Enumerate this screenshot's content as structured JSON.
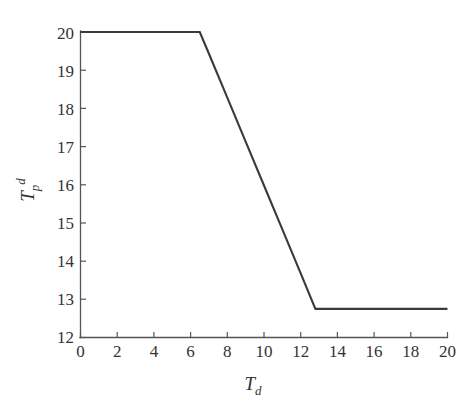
{
  "chart_data": {
    "type": "line",
    "title": "",
    "subtitle": "",
    "xlabel": "T_d",
    "xlabel_base": "T",
    "xlabel_sub": "d",
    "ylabel": "T_p^d",
    "ylabel_base": "T",
    "ylabel_sub": "p",
    "ylabel_sup": "d",
    "xlim": [
      0,
      20
    ],
    "ylim": [
      12,
      20
    ],
    "grid": false,
    "legend": null,
    "legend_position": "none",
    "xticks": [
      0,
      2,
      4,
      6,
      8,
      10,
      12,
      14,
      16,
      18,
      20
    ],
    "xtick_labels": [
      "0",
      "2",
      "4",
      "6",
      "8",
      "10",
      "12",
      "14",
      "16",
      "18",
      "20"
    ],
    "yticks": [
      12,
      13,
      14,
      15,
      16,
      17,
      18,
      19,
      20
    ],
    "ytick_labels": [
      "12",
      "13",
      "14",
      "15",
      "16",
      "17",
      "18",
      "19",
      "20"
    ],
    "series": [
      {
        "name": "Tp_d vs Td",
        "color": "#3a3a3a",
        "x": [
          0.0,
          1.0,
          2.0,
          3.0,
          4.0,
          5.0,
          6.0,
          6.5,
          7.0,
          8.0,
          9.0,
          10.0,
          11.0,
          12.0,
          12.8,
          13.0,
          14.0,
          15.0,
          16.0,
          17.0,
          18.0,
          19.0,
          20.0
        ],
        "y": [
          20.0,
          20.0,
          20.0,
          20.0,
          20.0,
          20.0,
          20.0,
          20.0,
          19.43,
          18.28,
          17.13,
          15.98,
          14.83,
          13.68,
          12.75,
          12.75,
          12.75,
          12.75,
          12.75,
          12.75,
          12.75,
          12.75,
          12.75
        ]
      }
    ],
    "breakpoints": [
      {
        "x": 6.5,
        "y": 20.0
      },
      {
        "x": 12.8,
        "y": 12.75
      }
    ],
    "annotations": []
  },
  "figure": {
    "background_color": "#ffffff",
    "axis_color": "#555555",
    "line_color": "#3a3a3a"
  }
}
